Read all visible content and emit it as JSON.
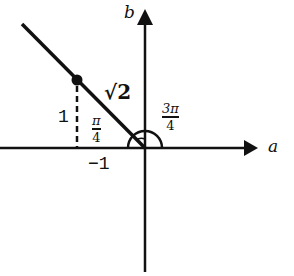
{
  "diagram": {
    "axes": {
      "horizontal_label": "a",
      "vertical_label": "b"
    },
    "labels": {
      "hypotenuse": "√2",
      "vertical_leg": "1",
      "horizontal_tick": "−1",
      "inner_angle_num": "π",
      "inner_angle_den": "4",
      "outer_angle_num": "3π",
      "outer_angle_den": "4"
    },
    "colors": {
      "stroke": "#111111",
      "background": "#ffffff"
    }
  }
}
